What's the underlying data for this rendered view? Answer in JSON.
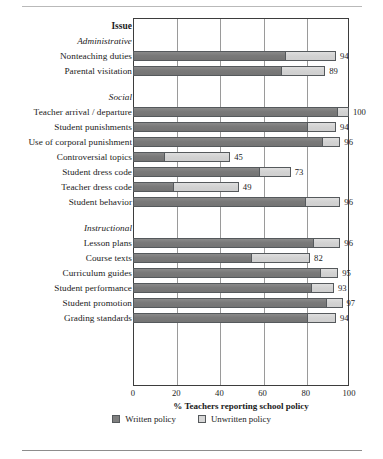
{
  "chart_data": {
    "type": "bar",
    "orientation": "horizontal",
    "stacked": true,
    "title": "",
    "xlabel": "% Teachers reporting school policy",
    "ylabel": "Issue",
    "xlim": [
      0,
      100
    ],
    "xticks": [
      0,
      20,
      40,
      60,
      80,
      100
    ],
    "grid": true,
    "legend_position": "bottom-center",
    "series": [
      {
        "name": "Written policy",
        "color": "#7f7f7f"
      },
      {
        "name": "Unwritten policy",
        "color": "#d4d4d4"
      }
    ],
    "groups": [
      {
        "name": "Administrative",
        "items": [
          {
            "label": "Nonteaching duties",
            "written": 71,
            "unwritten": 23,
            "total": 94
          },
          {
            "label": "Parental visitation",
            "written": 69,
            "unwritten": 20,
            "total": 89
          }
        ]
      },
      {
        "name": "Social",
        "items": [
          {
            "label": "Teacher arrival / departure",
            "written": 95,
            "unwritten": 5,
            "total": 100
          },
          {
            "label": "Student punishments",
            "written": 81,
            "unwritten": 13,
            "total": 94
          },
          {
            "label": "Use of corporal punishment",
            "written": 88,
            "unwritten": 8,
            "total": 96
          },
          {
            "label": "Controversial topics",
            "written": 15,
            "unwritten": 30,
            "total": 45
          },
          {
            "label": "Student dress code",
            "written": 59,
            "unwritten": 14,
            "total": 73
          },
          {
            "label": "Teacher dress code",
            "written": 19,
            "unwritten": 30,
            "total": 49
          },
          {
            "label": "Student behavior",
            "written": 80,
            "unwritten": 16,
            "total": 96
          }
        ]
      },
      {
        "name": "Instructional",
        "items": [
          {
            "label": "Lesson plans",
            "written": 84,
            "unwritten": 12,
            "total": 96
          },
          {
            "label": "Course texts",
            "written": 55,
            "unwritten": 27,
            "total": 82
          },
          {
            "label": "Curriculum guides",
            "written": 87,
            "unwritten": 8,
            "total": 95
          },
          {
            "label": "Student performance",
            "written": 83,
            "unwritten": 10,
            "total": 93
          },
          {
            "label": "Student promotion",
            "written": 90,
            "unwritten": 7,
            "total": 97
          },
          {
            "label": "Grading standards",
            "written": 81,
            "unwritten": 13,
            "total": 94
          }
        ]
      }
    ]
  },
  "axis": {
    "y_header": "Issue",
    "x_title": "% Teachers reporting school policy",
    "ticks": [
      "0",
      "20",
      "40",
      "60",
      "80",
      "100"
    ]
  },
  "legend": {
    "written_label": "Written policy",
    "unwritten_label": "Unwritten policy"
  },
  "groups": {
    "administrative": "Administrative",
    "social": "Social",
    "instructional": "Instructional"
  },
  "values": {
    "nonteaching_duties": "94",
    "parental_visitation": "89",
    "teacher_arrival": "100",
    "student_punishments": "94",
    "corporal_punishment": "96",
    "controversial_topics": "45",
    "student_dress_code": "73",
    "teacher_dress_code": "49",
    "student_behavior": "96",
    "lesson_plans": "96",
    "course_texts": "82",
    "curriculum_guides": "95",
    "student_performance": "93",
    "student_promotion": "97",
    "grading_standards": "94"
  },
  "labels": {
    "nonteaching_duties": "Nonteaching duties",
    "parental_visitation": "Parental visitation",
    "teacher_arrival": "Teacher arrival / departure",
    "student_punishments": "Student punishments",
    "corporal_punishment": "Use of corporal punishment",
    "controversial_topics": "Controversial topics",
    "student_dress_code": "Student dress code",
    "teacher_dress_code": "Teacher dress code",
    "student_behavior": "Student behavior",
    "lesson_plans": "Lesson plans",
    "course_texts": "Course texts",
    "curriculum_guides": "Curriculum guides",
    "student_performance": "Student performance",
    "student_promotion": "Student promotion",
    "grading_standards": "Grading standards"
  }
}
